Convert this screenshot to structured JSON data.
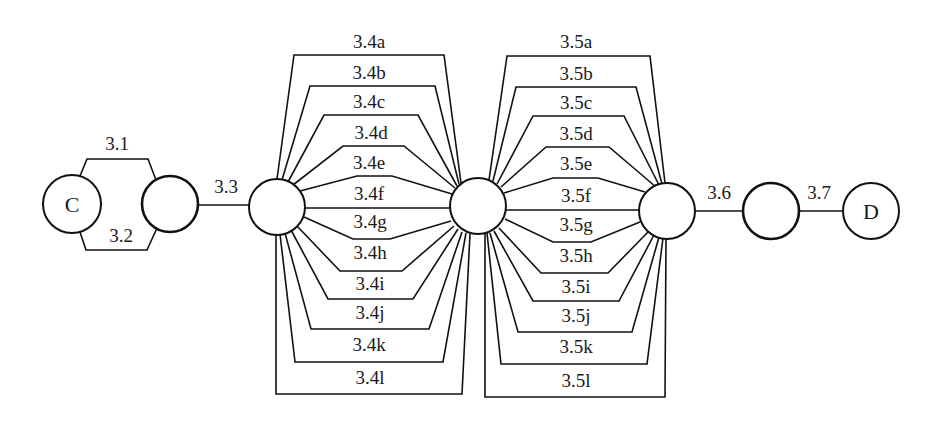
{
  "diagram": {
    "type": "series-parallel reliability block diagram",
    "colors": {
      "stroke": "#111111",
      "text": "#1a1a1a",
      "background": "#ffffff"
    },
    "nodes": [
      {
        "id": "C",
        "label": "C",
        "cx": 72,
        "cy": 204,
        "r": 29,
        "thick": false
      },
      {
        "id": "n1",
        "label": "",
        "cx": 170,
        "cy": 204,
        "r": 28,
        "thick": true
      },
      {
        "id": "n2",
        "label": "",
        "cx": 277,
        "cy": 207,
        "r": 28,
        "thick": false
      },
      {
        "id": "n3",
        "label": "",
        "cx": 478,
        "cy": 206,
        "r": 28,
        "thick": false
      },
      {
        "id": "n4",
        "label": "",
        "cx": 667,
        "cy": 211,
        "r": 28,
        "thick": false
      },
      {
        "id": "n5",
        "label": "",
        "cx": 771,
        "cy": 211,
        "r": 28,
        "thick": true
      },
      {
        "id": "D",
        "label": "D",
        "cx": 871,
        "cy": 211,
        "r": 28,
        "thick": false
      }
    ],
    "edges": [
      {
        "id": "3.1",
        "label": "3.1",
        "from": "C",
        "to": "n1",
        "points": [
          [
            80,
            176
          ],
          [
            87,
            159
          ],
          [
            148,
            159
          ],
          [
            156,
            180
          ]
        ],
        "lx": 117,
        "ly": 150
      },
      {
        "id": "3.2",
        "label": "3.2",
        "from": "C",
        "to": "n1",
        "points": [
          [
            80,
            232
          ],
          [
            86,
            250
          ],
          [
            147,
            250
          ],
          [
            157,
            228
          ]
        ],
        "lx": 121,
        "ly": 242
      },
      {
        "id": "3.3",
        "label": "3.3",
        "from": "n1",
        "to": "n2",
        "points": [
          [
            198,
            205
          ],
          [
            249,
            205
          ]
        ],
        "lx": 226,
        "ly": 193
      },
      {
        "id": "3.4a",
        "label": "3.4a",
        "from": "n2",
        "to": "n3",
        "points": [
          [
            277,
            179
          ],
          [
            294,
            55
          ],
          [
            444,
            55
          ],
          [
            461,
            183
          ]
        ],
        "lx": 369,
        "ly": 48
      },
      {
        "id": "3.4b",
        "label": "3.4b",
        "from": "n2",
        "to": "n3",
        "points": [
          [
            282,
            180
          ],
          [
            310,
            86
          ],
          [
            435,
            86
          ],
          [
            459,
            184
          ]
        ],
        "lx": 369,
        "ly": 79
      },
      {
        "id": "3.4c",
        "label": "3.4c",
        "from": "n2",
        "to": "n3",
        "points": [
          [
            288,
            182
          ],
          [
            324,
            115
          ],
          [
            418,
            115
          ],
          [
            457,
            186
          ]
        ],
        "lx": 369,
        "ly": 108
      },
      {
        "id": "3.4d",
        "label": "3.4d",
        "from": "n2",
        "to": "n3",
        "points": [
          [
            293,
            185
          ],
          [
            343,
            146
          ],
          [
            404,
            146
          ],
          [
            455,
            188
          ]
        ],
        "lx": 371,
        "ly": 139
      },
      {
        "id": "3.4e",
        "label": "3.4e",
        "from": "n2",
        "to": "n3",
        "points": [
          [
            300,
            191
          ],
          [
            357,
            176
          ],
          [
            392,
            176
          ],
          [
            452,
            194
          ]
        ],
        "lx": 369,
        "ly": 169
      },
      {
        "id": "3.4f",
        "label": "3.4f",
        "from": "n2",
        "to": "n3",
        "points": [
          [
            305,
            208
          ],
          [
            450,
            208
          ]
        ],
        "lx": 369,
        "ly": 200
      },
      {
        "id": "3.4g",
        "label": "3.4g",
        "from": "n2",
        "to": "n3",
        "points": [
          [
            304,
            217
          ],
          [
            353,
            239
          ],
          [
            390,
            239
          ],
          [
            451,
            221
          ]
        ],
        "lx": 370,
        "ly": 228
      },
      {
        "id": "3.4h",
        "label": "3.4h",
        "from": "n2",
        "to": "n3",
        "points": [
          [
            297,
            226
          ],
          [
            340,
            271
          ],
          [
            402,
            271
          ],
          [
            454,
            226
          ]
        ],
        "lx": 370,
        "ly": 259
      },
      {
        "id": "3.4i",
        "label": "3.4i",
        "from": "n2",
        "to": "n3",
        "points": [
          [
            291,
            230
          ],
          [
            328,
            299
          ],
          [
            413,
            299
          ],
          [
            458,
            229
          ]
        ],
        "lx": 370,
        "ly": 290
      },
      {
        "id": "3.4j",
        "label": "3.4j",
        "from": "n2",
        "to": "n3",
        "points": [
          [
            285,
            233
          ],
          [
            311,
            329
          ],
          [
            429,
            329
          ],
          [
            462,
            232
          ]
        ],
        "lx": 370,
        "ly": 319
      },
      {
        "id": "3.4k",
        "label": "3.4k",
        "from": "n2",
        "to": "n3",
        "points": [
          [
            280,
            234
          ],
          [
            295,
            362
          ],
          [
            443,
            362
          ],
          [
            466,
            233
          ]
        ],
        "lx": 369,
        "ly": 351
      },
      {
        "id": "3.4l",
        "label": "3.4l",
        "from": "n2",
        "to": "n3",
        "points": [
          [
            276,
            234
          ],
          [
            276,
            394
          ],
          [
            462,
            394
          ],
          [
            470,
            234
          ]
        ],
        "lx": 370,
        "ly": 384
      },
      {
        "id": "3.5a",
        "label": "3.5a",
        "from": "n3",
        "to": "n4",
        "points": [
          [
            489,
            180
          ],
          [
            507,
            56
          ],
          [
            650,
            56
          ],
          [
            665,
            183
          ]
        ],
        "lx": 576,
        "ly": 48
      },
      {
        "id": "3.5b",
        "label": "3.5b",
        "from": "n3",
        "to": "n4",
        "points": [
          [
            493,
            181
          ],
          [
            516,
            87
          ],
          [
            636,
            87
          ],
          [
            662,
            184
          ]
        ],
        "lx": 576,
        "ly": 80
      },
      {
        "id": "3.5c",
        "label": "3.5c",
        "from": "n3",
        "to": "n4",
        "points": [
          [
            497,
            184
          ],
          [
            533,
            116
          ],
          [
            624,
            116
          ],
          [
            659,
            185
          ]
        ],
        "lx": 576,
        "ly": 109
      },
      {
        "id": "3.5d",
        "label": "3.5d",
        "from": "n3",
        "to": "n4",
        "points": [
          [
            501,
            187
          ],
          [
            546,
            147
          ],
          [
            609,
            147
          ],
          [
            656,
            187
          ]
        ],
        "lx": 576,
        "ly": 140
      },
      {
        "id": "3.5e",
        "label": "3.5e",
        "from": "n3",
        "to": "n4",
        "points": [
          [
            504,
            193
          ],
          [
            553,
            178
          ],
          [
            598,
            178
          ],
          [
            645,
            192
          ]
        ],
        "lx": 576,
        "ly": 170
      },
      {
        "id": "3.5f",
        "label": "3.5f",
        "from": "n3",
        "to": "n4",
        "points": [
          [
            506,
            210
          ],
          [
            639,
            210
          ]
        ],
        "lx": 576,
        "ly": 202
      },
      {
        "id": "3.5g",
        "label": "3.5g",
        "from": "n3",
        "to": "n4",
        "points": [
          [
            505,
            219
          ],
          [
            553,
            242
          ],
          [
            591,
            242
          ],
          [
            640,
            222
          ]
        ],
        "lx": 576,
        "ly": 231
      },
      {
        "id": "3.5h",
        "label": "3.5h",
        "from": "n3",
        "to": "n4",
        "points": [
          [
            499,
            228
          ],
          [
            541,
            273
          ],
          [
            608,
            273
          ],
          [
            648,
            232
          ]
        ],
        "lx": 576,
        "ly": 262
      },
      {
        "id": "3.5i",
        "label": "3.5i",
        "from": "n3",
        "to": "n4",
        "points": [
          [
            494,
            231
          ],
          [
            533,
            301
          ],
          [
            619,
            301
          ],
          [
            654,
            235
          ]
        ],
        "lx": 576,
        "ly": 293
      },
      {
        "id": "3.5j",
        "label": "3.5j",
        "from": "n3",
        "to": "n4",
        "points": [
          [
            490,
            233
          ],
          [
            518,
            332
          ],
          [
            632,
            332
          ],
          [
            659,
            237
          ]
        ],
        "lx": 576,
        "ly": 322
      },
      {
        "id": "3.5k",
        "label": "3.5k",
        "from": "n3",
        "to": "n4",
        "points": [
          [
            487,
            233
          ],
          [
            501,
            364
          ],
          [
            647,
            364
          ],
          [
            663,
            238
          ]
        ],
        "lx": 576,
        "ly": 353
      },
      {
        "id": "3.5l",
        "label": "3.5l",
        "from": "n3",
        "to": "n4",
        "points": [
          [
            485,
            233
          ],
          [
            485,
            397
          ],
          [
            665,
            397
          ],
          [
            666,
            239
          ]
        ],
        "lx": 576,
        "ly": 387
      },
      {
        "id": "3.6",
        "label": "3.6",
        "from": "n4",
        "to": "n5",
        "points": [
          [
            695,
            211
          ],
          [
            743,
            211
          ]
        ],
        "lx": 719,
        "ly": 199
      },
      {
        "id": "3.7",
        "label": "3.7",
        "from": "n5",
        "to": "D",
        "points": [
          [
            799,
            211
          ],
          [
            843,
            211
          ]
        ],
        "lx": 819,
        "ly": 199
      }
    ]
  }
}
